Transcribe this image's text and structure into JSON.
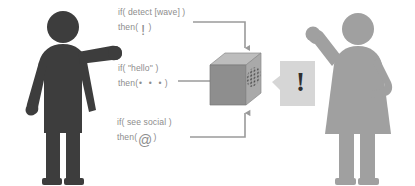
{
  "scene": {
    "title": "Smart device conditional rules illustration",
    "width": 415,
    "height": 186,
    "background": "#ffffff"
  },
  "colors": {
    "person_left": "#3d3d3d",
    "person_right": "#a0a0a0",
    "text": "#8d8d8d",
    "connector": "#9a9a9a",
    "cube_top": "#b4b4b4",
    "cube_left": "#8e8e8e",
    "cube_right": "#a8a8a8",
    "bubble": "#d6d6d6",
    "bubble_mark": "#2f2f2f"
  },
  "actors": {
    "left": {
      "name": "person-waving-left",
      "pose": "arm extended right, waving",
      "color_label": "dark-gray"
    },
    "right": {
      "name": "person-waving-right",
      "pose": "arm raised waving, hand on hip",
      "color_label": "light-gray"
    }
  },
  "rules": [
    {
      "id": "wave",
      "condition": "if( detect [wave] )",
      "then_prefix": "then(",
      "then_glyph": "!",
      "then_glyph_name": "exclamation-glyph",
      "then_suffix": ")"
    },
    {
      "id": "hello",
      "condition": "if( \"hello\" )",
      "then_prefix": "then(",
      "then_glyph": "• • •",
      "then_glyph_name": "three-dots-glyph",
      "then_suffix": ")"
    },
    {
      "id": "social",
      "condition": "if( see social )",
      "then_prefix": "then(",
      "then_glyph": "@",
      "then_glyph_name": "at-sign-glyph",
      "then_suffix": ")"
    }
  ],
  "device": {
    "name": "smart-speaker-cube",
    "feature": "speaker-grille"
  },
  "bubble": {
    "name": "speech-bubble",
    "text": "!"
  },
  "connectors": [
    {
      "id": "wave-to-device",
      "from": "rule-wave",
      "to": "device-top"
    },
    {
      "id": "hello-to-device",
      "from": "rule-hello",
      "to": "device-left"
    },
    {
      "id": "social-to-device",
      "from": "rule-social",
      "to": "device-bottom"
    }
  ]
}
